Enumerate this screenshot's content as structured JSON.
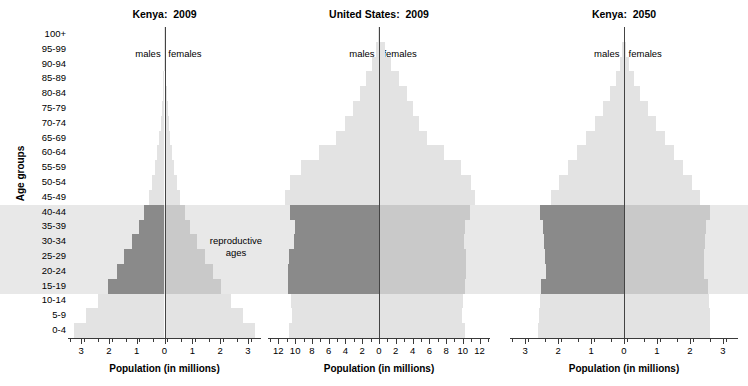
{
  "figure": {
    "ylabel": "Age groups",
    "xlabel": "Population (in millions)",
    "males_label": "males",
    "females_label": "females",
    "annotation": "reproductive\nages",
    "age_groups": [
      "100+",
      "95-99",
      "90-94",
      "85-89",
      "80-84",
      "75-79",
      "70-74",
      "65-69",
      "60-64",
      "55-59",
      "50-54",
      "45-49",
      "40-44",
      "35-39",
      "30-34",
      "25-29",
      "20-24",
      "15-19",
      "10-14",
      "5-9",
      "0-4"
    ],
    "reproductive_band": [
      "15-19",
      "40-44"
    ],
    "colors": {
      "bar_light": "#e3e3e3",
      "bar_band_female": "#c9c9c9",
      "bar_band_male": "#8a8a8a",
      "band_background": "#e8e8e8",
      "axis": "#3a3a3a",
      "text": "#000000"
    }
  },
  "chart_data": [
    {
      "type": "bar",
      "title": "Kenya:  2009",
      "xlabel": "Population (in millions)",
      "ylabel": "Age groups",
      "xlim": [
        -3.4,
        3.4
      ],
      "xticks": [
        3,
        2,
        1,
        0,
        1,
        2,
        3
      ],
      "xtick_values": [
        -3,
        -2,
        -1,
        0,
        1,
        2,
        3
      ],
      "xminor_step": 0.5,
      "grid": false,
      "categories": [
        "100+",
        "95-99",
        "90-94",
        "85-89",
        "80-84",
        "75-79",
        "70-74",
        "65-69",
        "60-64",
        "55-59",
        "50-54",
        "45-49",
        "40-44",
        "35-39",
        "30-34",
        "25-29",
        "20-24",
        "15-19",
        "10-14",
        "5-9",
        "0-4"
      ],
      "series": [
        {
          "name": "males",
          "values": [
            0.005,
            0.012,
            0.025,
            0.045,
            0.07,
            0.1,
            0.14,
            0.19,
            0.26,
            0.34,
            0.44,
            0.56,
            0.72,
            0.92,
            1.16,
            1.44,
            1.72,
            2.02,
            2.4,
            2.82,
            3.25
          ]
        },
        {
          "name": "females",
          "values": [
            0.005,
            0.014,
            0.028,
            0.05,
            0.078,
            0.11,
            0.15,
            0.2,
            0.27,
            0.35,
            0.45,
            0.57,
            0.73,
            0.93,
            1.17,
            1.45,
            1.73,
            2.03,
            2.41,
            2.83,
            3.26
          ]
        }
      ],
      "legend": [
        "males",
        "females"
      ],
      "legend_position": "inside-top"
    },
    {
      "type": "bar",
      "title": "United States:  2009",
      "xlabel": "Population (in millions)",
      "ylabel": "Age groups",
      "xlim": [
        -13.0,
        13.0
      ],
      "xticks": [
        12,
        10,
        8,
        6,
        4,
        2,
        0,
        2,
        4,
        6,
        8,
        10,
        12
      ],
      "xtick_values": [
        -12,
        -10,
        -8,
        -6,
        -4,
        -2,
        0,
        2,
        4,
        6,
        8,
        10,
        12
      ],
      "xminor_step": 1,
      "grid": false,
      "categories": [
        "100+",
        "95-99",
        "90-94",
        "85-89",
        "80-84",
        "75-79",
        "70-74",
        "65-69",
        "60-64",
        "55-59",
        "50-54",
        "45-49",
        "40-44",
        "35-39",
        "30-34",
        "25-29",
        "20-24",
        "15-19",
        "10-14",
        "5-9",
        "0-4"
      ],
      "series": [
        {
          "name": "males",
          "values": [
            0.06,
            0.35,
            0.8,
            1.55,
            2.3,
            3.1,
            4.05,
            5.1,
            7.2,
            9.3,
            10.6,
            11.2,
            10.6,
            10.0,
            10.1,
            10.7,
            10.9,
            10.8,
            10.5,
            10.4,
            10.7
          ]
        },
        {
          "name": "females",
          "values": [
            0.14,
            0.7,
            1.45,
            2.4,
            3.3,
            4.0,
            4.8,
            5.75,
            7.8,
            9.8,
            11.0,
            11.5,
            10.9,
            10.2,
            10.1,
            10.4,
            10.4,
            10.3,
            10.05,
            9.95,
            10.25
          ]
        }
      ],
      "legend": [
        "males",
        "females"
      ],
      "legend_position": "inside-top"
    },
    {
      "type": "bar",
      "title": "Kenya:  2050",
      "xlabel": "Population (in millions)",
      "ylabel": "Age groups",
      "xlim": [
        -3.4,
        3.4
      ],
      "xticks": [
        3,
        2,
        1,
        0,
        1,
        2,
        3
      ],
      "xtick_values": [
        -3,
        -2,
        -1,
        0,
        1,
        2,
        3
      ],
      "xminor_step": 0.5,
      "grid": false,
      "categories": [
        "100+",
        "95-99",
        "90-94",
        "85-89",
        "80-84",
        "75-79",
        "70-74",
        "65-69",
        "60-64",
        "55-59",
        "50-54",
        "45-49",
        "40-44",
        "35-39",
        "30-34",
        "25-29",
        "20-24",
        "15-19",
        "10-14",
        "5-9",
        "0-4"
      ],
      "series": [
        {
          "name": "males",
          "values": [
            0.015,
            0.05,
            0.12,
            0.24,
            0.42,
            0.64,
            0.88,
            1.14,
            1.42,
            1.7,
            1.98,
            2.22,
            2.56,
            2.46,
            2.42,
            2.4,
            2.38,
            2.52,
            2.56,
            2.58,
            2.6
          ]
        },
        {
          "name": "females",
          "values": [
            0.02,
            0.07,
            0.16,
            0.3,
            0.5,
            0.74,
            0.98,
            1.24,
            1.52,
            1.8,
            2.06,
            2.3,
            2.6,
            2.5,
            2.46,
            2.44,
            2.42,
            2.54,
            2.58,
            2.6,
            2.62
          ]
        }
      ],
      "legend": [
        "males",
        "females"
      ],
      "legend_position": "inside-top"
    }
  ]
}
